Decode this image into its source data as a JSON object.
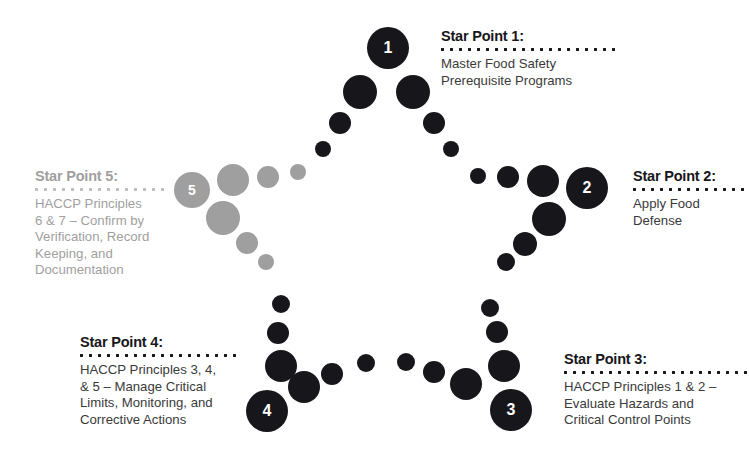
{
  "diagram": {
    "colors": {
      "active": "#17161a",
      "inactive": "#9f9f9f",
      "rule_active": "#17161a",
      "rule_inactive": "#bfbfbf",
      "body_active": "#3a3a3a",
      "number_text": "#ffffff",
      "background": "#ffffff"
    },
    "points": [
      {
        "number": "1",
        "title": "Star Point 1:",
        "body": "Master Food Safety\nPrerequisite Programs",
        "state": "active"
      },
      {
        "number": "2",
        "title": "Star Point 2:",
        "body": "Apply Food\nDefense",
        "state": "active"
      },
      {
        "number": "3",
        "title": "Star Point 3:",
        "body": "HACCP Principles 1 & 2 –\nEvaluate Hazards and\nCritical Control Points",
        "state": "active"
      },
      {
        "number": "4",
        "title": "Star Point 4:",
        "body": "HACCP Principles 3, 4,\n& 5 – Manage Critical\nLimits, Monitoring, and\nCorrective Actions",
        "state": "active"
      },
      {
        "number": "5",
        "title": "Star Point 5:",
        "body": "HACCP Principles\n6 & 7 – Confirm by\nVerification, Record\nKeeping, and\nDocumentation",
        "state": "inactive"
      }
    ]
  },
  "chart_data": {
    "type": "diagram",
    "shape": "five-pointed-star-outline-of-dots",
    "numbered_nodes": [
      {
        "label": "1",
        "cx": 388,
        "cy": 48,
        "r": 21,
        "color": "#17161a"
      },
      {
        "label": "2",
        "cx": 587,
        "cy": 188,
        "r": 21,
        "color": "#17161a"
      },
      {
        "label": "3",
        "cx": 511,
        "cy": 410,
        "r": 21,
        "color": "#17161a"
      },
      {
        "label": "4",
        "cx": 267,
        "cy": 411,
        "r": 21,
        "color": "#17161a"
      },
      {
        "label": "5",
        "cx": 192,
        "cy": 190,
        "r": 18,
        "color": "#9f9f9f"
      }
    ],
    "dots": [
      {
        "cx": 360,
        "cy": 92,
        "r": 17,
        "color": "#17161a"
      },
      {
        "cx": 413,
        "cy": 92,
        "r": 17,
        "color": "#17161a"
      },
      {
        "cx": 340,
        "cy": 123,
        "r": 11,
        "color": "#17161a"
      },
      {
        "cx": 434,
        "cy": 123,
        "r": 11,
        "color": "#17161a"
      },
      {
        "cx": 323,
        "cy": 149,
        "r": 8,
        "color": "#17161a"
      },
      {
        "cx": 451,
        "cy": 149,
        "r": 8,
        "color": "#17161a"
      },
      {
        "cx": 478,
        "cy": 176,
        "r": 8,
        "color": "#17161a"
      },
      {
        "cx": 508,
        "cy": 177,
        "r": 11,
        "color": "#17161a"
      },
      {
        "cx": 543,
        "cy": 181,
        "r": 16,
        "color": "#17161a"
      },
      {
        "cx": 549,
        "cy": 219,
        "r": 17,
        "color": "#17161a"
      },
      {
        "cx": 525,
        "cy": 244,
        "r": 12,
        "color": "#17161a"
      },
      {
        "cx": 506,
        "cy": 262,
        "r": 9,
        "color": "#17161a"
      },
      {
        "cx": 490,
        "cy": 308,
        "r": 9,
        "color": "#17161a"
      },
      {
        "cx": 497,
        "cy": 332,
        "r": 11,
        "color": "#17161a"
      },
      {
        "cx": 504,
        "cy": 366,
        "r": 16,
        "color": "#17161a"
      },
      {
        "cx": 466,
        "cy": 384,
        "r": 16,
        "color": "#17161a"
      },
      {
        "cx": 434,
        "cy": 372,
        "r": 11,
        "color": "#17161a"
      },
      {
        "cx": 406,
        "cy": 362,
        "r": 9,
        "color": "#17161a"
      },
      {
        "cx": 366,
        "cy": 363,
        "r": 9,
        "color": "#17161a"
      },
      {
        "cx": 332,
        "cy": 374,
        "r": 11,
        "color": "#17161a"
      },
      {
        "cx": 304,
        "cy": 387,
        "r": 16,
        "color": "#17161a"
      },
      {
        "cx": 281,
        "cy": 366,
        "r": 16,
        "color": "#17161a"
      },
      {
        "cx": 278,
        "cy": 333,
        "r": 11,
        "color": "#17161a"
      },
      {
        "cx": 281,
        "cy": 304,
        "r": 9,
        "color": "#17161a"
      },
      {
        "cx": 266,
        "cy": 262,
        "r": 8,
        "color": "#9f9f9f"
      },
      {
        "cx": 247,
        "cy": 243,
        "r": 11,
        "color": "#9f9f9f"
      },
      {
        "cx": 223,
        "cy": 218,
        "r": 17,
        "color": "#9f9f9f"
      },
      {
        "cx": 233,
        "cy": 180,
        "r": 16,
        "color": "#9f9f9f"
      },
      {
        "cx": 268,
        "cy": 177,
        "r": 11,
        "color": "#9f9f9f"
      },
      {
        "cx": 298,
        "cy": 172,
        "r": 8,
        "color": "#9f9f9f"
      }
    ]
  }
}
